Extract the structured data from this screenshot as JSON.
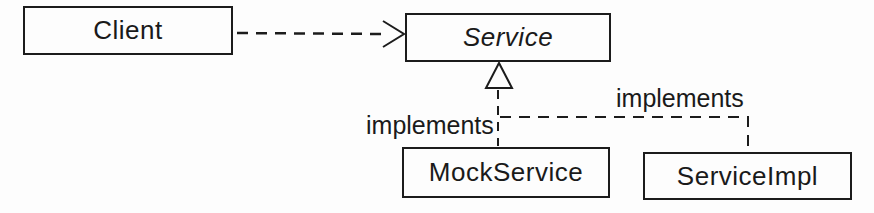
{
  "diagram": {
    "type": "uml-class-diagram",
    "background": "#fdfdfd",
    "line_color": "#1c1c1c",
    "nodes": [
      {
        "id": "client",
        "label": "Client",
        "shape": "rectangle",
        "text_style": "normal"
      },
      {
        "id": "service",
        "label": "Service",
        "shape": "rectangle",
        "text_style": "italic"
      },
      {
        "id": "mock-service",
        "label": "MockService",
        "shape": "rectangle",
        "text_style": "normal"
      },
      {
        "id": "service-impl",
        "label": "ServiceImpl",
        "shape": "rectangle",
        "text_style": "normal"
      }
    ],
    "edges": [
      {
        "from": "client",
        "to": "service",
        "type": "dependency",
        "line": "dashed",
        "arrowhead": "open",
        "label": ""
      },
      {
        "from": "mock-service",
        "to": "service",
        "type": "realization",
        "line": "dashed",
        "arrowhead": "hollow-triangle",
        "label": "implements"
      },
      {
        "from": "service-impl",
        "to": "service",
        "type": "realization",
        "line": "dashed",
        "arrowhead": "hollow-triangle",
        "label": "implements"
      }
    ]
  }
}
